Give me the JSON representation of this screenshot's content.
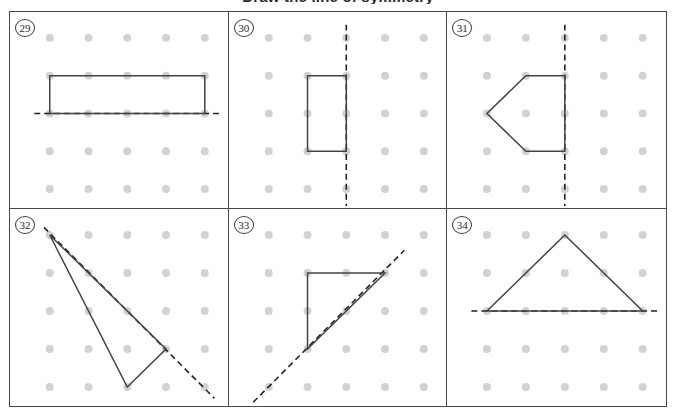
{
  "heading": "Draw the line of symmetry",
  "worksheet": {
    "grid_columns": 3,
    "grid_rows": 2,
    "dot_color": "#d2d2d2",
    "shape_color": "#444444",
    "symmetry_line_color": "#222222",
    "panel_border_color": "#4a4a4a"
  },
  "panels": [
    {
      "number": "29",
      "dot_grid": {
        "cols": 5,
        "rows": 5,
        "x0": 40,
        "y0": 26,
        "dx": 39,
        "dy": 38,
        "radius": 4
      },
      "shape": {
        "name": "rectangle",
        "closed": true,
        "points": [
          [
            1,
            2
          ],
          [
            5,
            2
          ],
          [
            5,
            3
          ],
          [
            1,
            3
          ]
        ]
      },
      "symmetry_line": {
        "orientation": "horizontal",
        "from": [
          0.6,
          3
        ],
        "to": [
          5.45,
          3
        ]
      }
    },
    {
      "number": "30",
      "dot_grid": {
        "cols": 5,
        "rows": 5,
        "x0": 40,
        "y0": 26,
        "dx": 39,
        "dy": 38,
        "radius": 4
      },
      "shape": {
        "name": "rectangle",
        "closed": true,
        "points": [
          [
            2,
            2
          ],
          [
            3,
            2
          ],
          [
            3,
            4
          ],
          [
            2,
            4
          ]
        ]
      },
      "symmetry_line": {
        "orientation": "vertical",
        "from": [
          3,
          0.65
        ],
        "to": [
          3,
          5.45
        ]
      }
    },
    {
      "number": "31",
      "dot_grid": {
        "cols": 5,
        "rows": 5,
        "x0": 40,
        "y0": 26,
        "dx": 39,
        "dy": 38,
        "radius": 4
      },
      "shape": {
        "name": "pentagon-arrow",
        "closed": true,
        "points": [
          [
            3,
            2
          ],
          [
            2,
            2
          ],
          [
            1,
            3
          ],
          [
            2,
            4
          ],
          [
            3,
            4
          ]
        ]
      },
      "symmetry_line": {
        "orientation": "vertical",
        "from": [
          3,
          0.65
        ],
        "to": [
          3,
          5.45
        ]
      }
    },
    {
      "number": "32",
      "dot_grid": {
        "cols": 5,
        "rows": 5,
        "x0": 40,
        "y0": 26,
        "dx": 39,
        "dy": 38,
        "radius": 4
      },
      "shape": {
        "name": "arrowhead-quadrilateral",
        "closed": true,
        "points": [
          [
            1,
            1
          ],
          [
            4,
            4
          ],
          [
            3,
            5
          ]
        ]
      },
      "symmetry_line": {
        "orientation": "diagonal",
        "from": [
          0.85,
          0.8
        ],
        "to": [
          5.25,
          5.3
        ]
      }
    },
    {
      "number": "33",
      "dot_grid": {
        "cols": 5,
        "rows": 5,
        "x0": 40,
        "y0": 26,
        "dx": 39,
        "dy": 38,
        "radius": 4
      },
      "shape": {
        "name": "right-triangle",
        "closed": true,
        "points": [
          [
            2,
            2
          ],
          [
            4,
            2
          ],
          [
            2,
            4
          ]
        ]
      },
      "symmetry_line": {
        "orientation": "diagonal",
        "from": [
          0.6,
          5.4
        ],
        "to": [
          4.5,
          1.4
        ]
      }
    },
    {
      "number": "34",
      "dot_grid": {
        "cols": 5,
        "rows": 5,
        "x0": 40,
        "y0": 26,
        "dx": 39,
        "dy": 38,
        "radius": 4
      },
      "shape": {
        "name": "triangle",
        "closed": true,
        "points": [
          [
            3,
            1
          ],
          [
            5,
            3
          ],
          [
            1,
            3
          ]
        ]
      },
      "symmetry_line": {
        "orientation": "horizontal",
        "from": [
          0.6,
          3
        ],
        "to": [
          5.45,
          3
        ]
      }
    }
  ]
}
